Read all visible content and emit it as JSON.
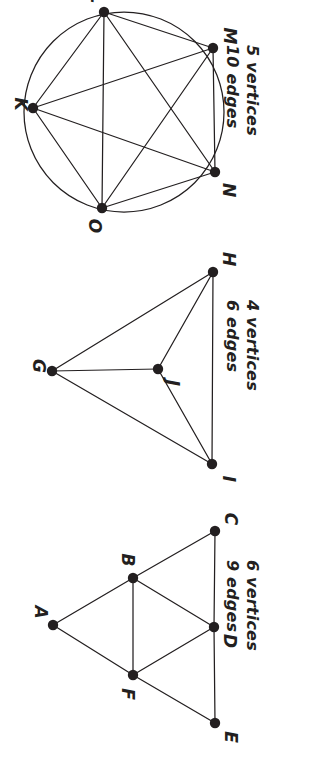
{
  "page": {
    "width": 315,
    "height": 762,
    "background": "#ffffff",
    "ink_color": "#231f20",
    "orientation_note": "sideways"
  },
  "graphs": [
    {
      "id": "k5-circle-graph",
      "name": "complete-graph-k5",
      "vertex_count_label": "5  vertices",
      "edge_count_label": "10  edges",
      "vertex_count": 5,
      "edge_count": 10,
      "has_circle_outline": true,
      "vertices": [
        {
          "label": "K",
          "x": 33,
          "y": 108,
          "label_x": 20,
          "label_y": 104
        },
        {
          "label": "L",
          "x": 104,
          "y": 12,
          "label_x": 96,
          "label_y": -2
        },
        {
          "label": "M",
          "x": 213,
          "y": 48,
          "label_x": 229,
          "label_y": 36
        },
        {
          "label": "N",
          "x": 215,
          "y": 172,
          "label_x": 228,
          "label_y": 190
        },
        {
          "label": "O",
          "x": 102,
          "y": 208,
          "label_x": 94,
          "label_y": 226
        }
      ],
      "edges": [
        [
          "K",
          "L"
        ],
        [
          "K",
          "M"
        ],
        [
          "K",
          "N"
        ],
        [
          "K",
          "O"
        ],
        [
          "L",
          "M"
        ],
        [
          "L",
          "N"
        ],
        [
          "L",
          "O"
        ],
        [
          "M",
          "N"
        ],
        [
          "M",
          "O"
        ],
        [
          "N",
          "O"
        ]
      ],
      "circle": {
        "cx": 124,
        "cy": 112,
        "r": 100
      }
    },
    {
      "id": "k4-graph",
      "name": "complete-graph-k4",
      "vertex_count_label": "4  vertices",
      "edge_count_label": "6  edges",
      "vertex_count": 4,
      "edge_count": 6,
      "has_circle_outline": false,
      "vertices": [
        {
          "label": "G",
          "x": 52,
          "y": 371,
          "label_x": 38,
          "label_y": 366
        },
        {
          "label": "H",
          "x": 213,
          "y": 272,
          "label_x": 228,
          "label_y": 259
        },
        {
          "label": "I",
          "x": 212,
          "y": 464,
          "label_x": 228,
          "label_y": 479
        },
        {
          "label": "J",
          "x": 158,
          "y": 369,
          "label_x": 172,
          "label_y": 383
        }
      ],
      "edges": [
        [
          "G",
          "H"
        ],
        [
          "G",
          "I"
        ],
        [
          "G",
          "J"
        ],
        [
          "H",
          "I"
        ],
        [
          "H",
          "J"
        ],
        [
          "I",
          "J"
        ]
      ]
    },
    {
      "id": "six-vertex-graph",
      "name": "six-vertex-nine-edge-graph",
      "vertex_count_label": "6  vertices",
      "edge_count_label": "9  edges",
      "vertex_count": 6,
      "edge_count": 9,
      "has_circle_outline": false,
      "vertices": [
        {
          "label": "A",
          "x": 53,
          "y": 625,
          "label_x": 40,
          "label_y": 612
        },
        {
          "label": "B",
          "x": 133,
          "y": 578,
          "label_x": 127,
          "label_y": 560
        },
        {
          "label": "C",
          "x": 215,
          "y": 531,
          "label_x": 230,
          "label_y": 519
        },
        {
          "label": "D",
          "x": 214,
          "y": 627,
          "label_x": 229,
          "label_y": 641
        },
        {
          "label": "E",
          "x": 215,
          "y": 723,
          "label_x": 230,
          "label_y": 737
        },
        {
          "label": "F",
          "x": 133,
          "y": 675,
          "label_x": 127,
          "label_y": 694
        }
      ],
      "edges": [
        [
          "A",
          "B"
        ],
        [
          "A",
          "F"
        ],
        [
          "B",
          "C"
        ],
        [
          "B",
          "D"
        ],
        [
          "B",
          "F"
        ],
        [
          "C",
          "D"
        ],
        [
          "D",
          "E"
        ],
        [
          "D",
          "F"
        ],
        [
          "E",
          "F"
        ]
      ]
    }
  ],
  "captions": [
    {
      "graph_id": "k5-circle-graph",
      "name": "caption-k5",
      "vertices_text": "5  vertices",
      "edges_text": "10  edges",
      "left": 262,
      "top": 45
    },
    {
      "graph_id": "k4-graph",
      "name": "caption-k4",
      "vertices_text": "4  vertices",
      "edges_text": "6  edges",
      "left": 262,
      "top": 300
    },
    {
      "graph_id": "six-vertex-graph",
      "name": "caption-six",
      "vertices_text": "6  vertices",
      "edges_text": "9  edges",
      "left": 262,
      "top": 560
    }
  ]
}
